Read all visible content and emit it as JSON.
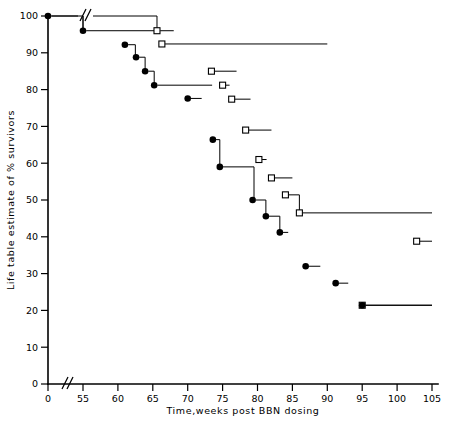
{
  "chart_data": {
    "type": "line",
    "title": "",
    "xlabel": "Time,weeks post BBN dosing",
    "ylabel": "Life table estimate of % survivors",
    "xlim": [
      50,
      106
    ],
    "ylim": [
      0,
      100
    ],
    "x_ticks": [
      0,
      55,
      60,
      65,
      70,
      75,
      80,
      85,
      90,
      95,
      100,
      105
    ],
    "x_tick_labels": [
      "0",
      "55",
      "60",
      "65",
      "70",
      "75",
      "80",
      "85",
      "90",
      "95",
      "100",
      "105"
    ],
    "y_ticks": [
      0,
      10,
      20,
      30,
      40,
      50,
      60,
      70,
      80,
      90,
      100
    ],
    "y_tick_labels": [
      "0",
      "10",
      "20",
      "30",
      "40",
      "50",
      "60",
      "70",
      "80",
      "90",
      "100"
    ],
    "axis_break": {
      "axis": "x",
      "label": "//",
      "between": [
        0,
        55
      ]
    },
    "grid": false,
    "legend": "none",
    "marker_styles": {
      "series_a": "filled-circle",
      "series_b": "open-square"
    },
    "series": [
      {
        "name": "Series A (filled circles)",
        "marker": "filled-circle",
        "points": [
          {
            "x": 50.0,
            "y": 100.0,
            "step_end": 55.0
          },
          {
            "x": 55.0,
            "y": 96.0,
            "step_end": 65.5
          },
          {
            "x": 61.0,
            "y": 92.2,
            "step_end": 62.5
          },
          {
            "x": 62.6,
            "y": 88.8,
            "step_end": 63.9
          },
          {
            "x": 63.9,
            "y": 85.0,
            "step_end": 65.2
          },
          {
            "x": 65.2,
            "y": 81.2,
            "step_end": 73.5
          },
          {
            "x": 70.0,
            "y": 77.6,
            "step_end": 72.0
          },
          {
            "x": 73.6,
            "y": 66.4,
            "step_end": 74.6
          },
          {
            "x": 74.6,
            "y": 59.0,
            "step_end": 79.5
          },
          {
            "x": 79.3,
            "y": 50.0,
            "step_end": 81.2
          },
          {
            "x": 81.2,
            "y": 45.6,
            "step_end": 83.2
          },
          {
            "x": 83.2,
            "y": 41.2,
            "step_end": 84.4
          },
          {
            "x": 86.9,
            "y": 32.0,
            "step_end": 89.0
          },
          {
            "x": 91.2,
            "y": 27.4,
            "step_end": 93.0
          },
          {
            "x": 95.0,
            "y": 21.4,
            "step_end": 105.0
          }
        ]
      },
      {
        "name": "Series B (open squares)",
        "marker": "open-square",
        "points": [
          {
            "x": 65.6,
            "y": 96.0,
            "step_end": 68.0
          },
          {
            "x": 66.3,
            "y": 92.4,
            "step_end": 90.0
          },
          {
            "x": 73.4,
            "y": 85.0,
            "step_end": 77.0
          },
          {
            "x": 75.0,
            "y": 81.2,
            "step_end": 76.0
          },
          {
            "x": 76.3,
            "y": 77.4,
            "step_end": 79.0
          },
          {
            "x": 78.3,
            "y": 69.0,
            "step_end": 82.0
          },
          {
            "x": 80.2,
            "y": 61.0,
            "step_end": 81.3
          },
          {
            "x": 82.0,
            "y": 56.0,
            "step_end": 85.0
          },
          {
            "x": 84.0,
            "y": 51.4,
            "step_end": 86.0
          },
          {
            "x": 86.0,
            "y": 46.5,
            "step_end": 105.0
          },
          {
            "x": 102.8,
            "y": 38.8,
            "step_end": 105.0
          },
          {
            "x": 95.0,
            "y": 21.4,
            "step_end": 105.0
          }
        ]
      }
    ]
  },
  "axis_titles": {
    "x": "Time,weeks post BBN dosing",
    "y": "Life table estimate of % survivors"
  }
}
